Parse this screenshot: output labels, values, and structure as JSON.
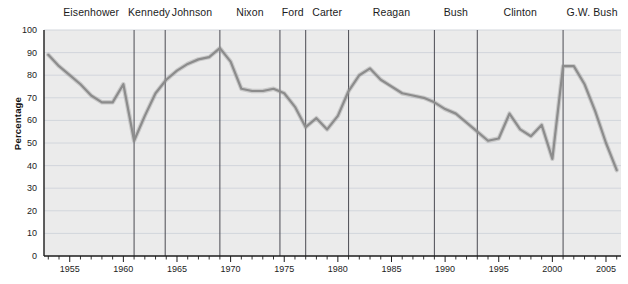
{
  "chart_data": {
    "type": "line",
    "title": "",
    "xlabel": "",
    "ylabel": "Percentage",
    "xlim": [
      1952.6,
      2006.4
    ],
    "ylim": [
      0,
      100
    ],
    "grid": true,
    "legend": "none",
    "y_ticks": [
      0,
      10,
      20,
      30,
      40,
      50,
      60,
      70,
      80,
      90,
      100
    ],
    "x_ticks_major": [
      1955,
      1960,
      1965,
      1970,
      1975,
      1980,
      1985,
      1990,
      1995,
      2000,
      2005
    ],
    "x_tick_minor_step": 1,
    "series": [
      {
        "name": "Percentage",
        "color": "#8c8c8c",
        "x": [
          1953,
          1954,
          1955,
          1956,
          1957,
          1958,
          1959,
          1960,
          1961,
          1962,
          1963,
          1964,
          1965,
          1966,
          1967,
          1968,
          1969,
          1970,
          1971,
          1972,
          1973,
          1974,
          1975,
          1976,
          1977,
          1978,
          1979,
          1980,
          1981,
          1982,
          1983,
          1984,
          1985,
          1986,
          1987,
          1988,
          1989,
          1990,
          1991,
          1992,
          1993,
          1994,
          1995,
          1996,
          1997,
          1998,
          1999,
          2000,
          2001,
          2002,
          2003,
          2004,
          2005,
          2006
        ],
        "values": [
          89,
          84,
          80,
          76,
          71,
          68,
          68,
          76,
          51,
          62,
          72,
          78,
          82,
          85,
          87,
          88,
          92,
          86,
          74,
          73,
          73,
          74,
          72,
          66,
          57,
          61,
          56,
          62,
          73,
          80,
          83,
          78,
          75,
          72,
          71,
          70,
          68,
          65,
          63,
          59,
          55,
          51,
          52,
          63,
          56,
          53,
          58,
          43,
          84,
          84,
          76,
          64,
          50,
          38
        ]
      }
    ],
    "presidents": [
      {
        "name": "Eisenhower",
        "start": 1953,
        "end": 1961,
        "center": 1957
      },
      {
        "name": "Kennedy",
        "start": 1961,
        "end": 1963.9,
        "center": 1962.4
      },
      {
        "name": "Johnson",
        "start": 1963.9,
        "end": 1969,
        "center": 1966.4
      },
      {
        "name": "Nixon",
        "start": 1969,
        "end": 1974.6,
        "center": 1971.8
      },
      {
        "name": "Ford",
        "start": 1974.6,
        "end": 1977,
        "center": 1975.8
      },
      {
        "name": "Carter",
        "start": 1977,
        "end": 1981,
        "center": 1979
      },
      {
        "name": "Reagan",
        "start": 1981,
        "end": 1989,
        "center": 1985
      },
      {
        "name": "Bush",
        "start": 1989,
        "end": 1993,
        "center": 1991
      },
      {
        "name": "Clinton",
        "start": 1993,
        "end": 2001,
        "center": 1997
      },
      {
        "name": "G.W. Bush",
        "start": 2001,
        "end": 2006.4,
        "center": 2003.7
      }
    ],
    "divider_years": [
      1961,
      1963.9,
      1969,
      1974.6,
      1977,
      1981,
      1989,
      1993,
      2001
    ]
  },
  "style": {
    "plot_background": "#ebebeb",
    "grid_color": "#d2d6dc",
    "axis_color": "#1c1c1c",
    "divider_color": "#4a4a52",
    "line_color": "#8c8c8c",
    "page_background": "#ffffff"
  }
}
